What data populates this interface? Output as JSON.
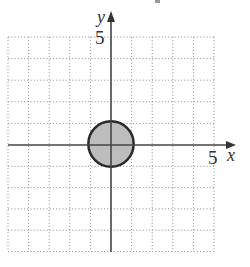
{
  "diagram": {
    "type": "coordinate-plane",
    "grid": {
      "x_range": [
        -5,
        5
      ],
      "y_range": [
        -5,
        5
      ],
      "step": 1,
      "style": "dotted",
      "color": "#9a9a9a"
    },
    "axes": {
      "x_label": "x",
      "y_label": "y",
      "x_tick_label": "5",
      "y_tick_label": "5",
      "color": "#444444"
    },
    "shapes": [
      {
        "type": "circle",
        "center": [
          0,
          0
        ],
        "radius": 1.1,
        "fill": "#bdbdbd",
        "stroke": "#2a2a2a",
        "stroke_width": 2.5
      }
    ]
  }
}
